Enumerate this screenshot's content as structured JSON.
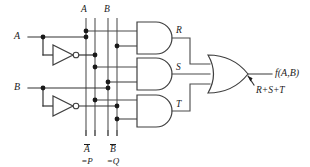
{
  "diagram": {
    "type": "logic-circuit-schematic",
    "background_color": "#ffffff",
    "wire_color": "#4a4a4a",
    "gate_outline_color": "#3f3f3f",
    "junction_color": "#1a1a1a",
    "label_color": "#1b1b1b"
  },
  "inputs": [
    {
      "id": "input-a",
      "label": "A",
      "x": 18,
      "y": 37
    },
    {
      "id": "input-b",
      "label": "B",
      "x": 18,
      "y": 88
    }
  ],
  "inverters": [
    {
      "id": "inverter-a",
      "input_label": "A",
      "output_label": "A-bar"
    },
    {
      "id": "inverter-b",
      "input_label": "B",
      "output_label": "B-bar"
    }
  ],
  "bus_labels_top": [
    {
      "id": "bus-label-a",
      "label": "A",
      "x": 81,
      "y": 10
    },
    {
      "id": "bus-label-b",
      "label": "B",
      "x": 103,
      "y": 10
    }
  ],
  "bus_labels_bottom": [
    {
      "id": "bus-label-a-bar",
      "label": "A",
      "overbar": true,
      "alias": "=P",
      "x": 85,
      "y": 141
    },
    {
      "id": "bus-label-b-bar",
      "label": "B",
      "overbar": true,
      "alias": "=Q",
      "x": 110,
      "y": 141
    }
  ],
  "and_gates": [
    {
      "id": "and-gate-r",
      "label": "R",
      "label_x": 169,
      "label_y": 28,
      "inputs": [
        "A",
        "B-bar"
      ]
    },
    {
      "id": "and-gate-s",
      "label": "S",
      "label_x": 169,
      "label_y": 68,
      "inputs": [
        "A-bar",
        "B"
      ]
    },
    {
      "id": "and-gate-t",
      "label": "T",
      "label_x": 169,
      "label_y": 105,
      "inputs": [
        "A-bar",
        "B-bar"
      ]
    }
  ],
  "or_gate": {
    "id": "or-gate-output",
    "inputs": [
      "R",
      "S",
      "T"
    ],
    "output_label": "f(A,B)",
    "output_label_x": 265,
    "output_label_y": 75,
    "expression": "R+S+T",
    "expression_x": 248,
    "expression_y": 88
  },
  "annotations": [
    {
      "id": "output-arrow",
      "kind": "arrow",
      "points_to": "or-gate-output-wire"
    }
  ]
}
